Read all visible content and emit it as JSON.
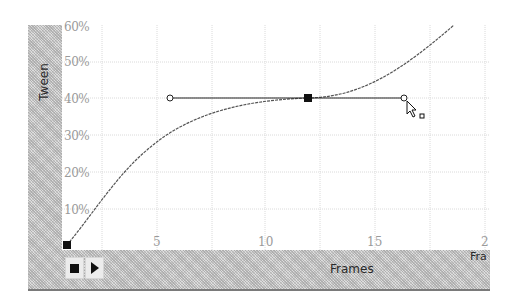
{
  "panel": {
    "y_axis_title": "Tween",
    "x_axis_title": "Frames",
    "x_axis_title_cut": "Fra"
  },
  "y_axis": {
    "labels": [
      {
        "text": "60%",
        "y": 20
      },
      {
        "text": "50%",
        "y": 55
      },
      {
        "text": "40%",
        "y": 92
      },
      {
        "text": "30%",
        "y": 129
      },
      {
        "text": "20%",
        "y": 166
      },
      {
        "text": "10%",
        "y": 203
      }
    ]
  },
  "x_axis": {
    "labels": [
      {
        "text": "5",
        "x": 153
      },
      {
        "text": "10",
        "x": 258
      },
      {
        "text": "15",
        "x": 367
      },
      {
        "text": "2",
        "x": 481
      }
    ]
  },
  "controls": {
    "stop_label": "stop",
    "play_label": "play"
  },
  "keyframes": [
    {
      "frame": 1,
      "tween": "0%"
    },
    {
      "frame": 12,
      "tween": "40%"
    }
  ],
  "handles": [
    {
      "frame": 6,
      "tween": "40%"
    },
    {
      "frame": 16.5,
      "tween": "40%"
    }
  ],
  "colors": {
    "grid": "#d8d8d8",
    "curve": "#555555",
    "handle_line": "#222222",
    "keyframe": "#111111",
    "panel_gray": "#c8c8c8",
    "label_gray": "#9a9a9a"
  }
}
